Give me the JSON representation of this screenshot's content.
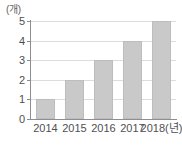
{
  "chart_data": {
    "type": "bar",
    "title": "",
    "subtitle": "",
    "xlabel": "2018(년)",
    "ylabel": "(개)",
    "unit_label": "(개)",
    "categories": [
      "2014",
      "2015",
      "2016",
      "2017",
      "2018(년)"
    ],
    "values": [
      1,
      2,
      3,
      4,
      5
    ],
    "series": [
      {
        "name": "",
        "values": [
          1,
          2,
          3,
          4,
          5
        ]
      }
    ],
    "ylim": [
      0,
      5
    ],
    "y_ticks": [
      "0",
      "1",
      "2",
      "3",
      "4",
      "5"
    ],
    "y_tick_values": [
      0,
      1,
      2,
      3,
      4,
      5
    ],
    "grid": true,
    "grid_orientation": "horizontal",
    "legend": false,
    "legend_position": "none",
    "annotations": [],
    "bar_color": "#c9c9c9",
    "bar_border_color": "#bdbdbd",
    "gridline_color": "#dcdcdc",
    "axis_color": "#8e8e90",
    "background_color": "#ffffff",
    "text_color": "#4f4f51"
  }
}
